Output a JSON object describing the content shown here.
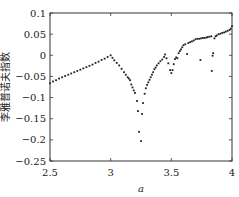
{
  "chart_data": {
    "type": "scatter",
    "title": "",
    "xlabel": "a",
    "ylabel": "李雅普诺夫指数",
    "xlim": [
      2.5,
      4
    ],
    "ylim": [
      -0.25,
      0.1
    ],
    "xticks": [
      2.5,
      3,
      3.5,
      4
    ],
    "xtick_labels": [
      "2.5",
      "3",
      "3.5",
      "4"
    ],
    "yticks": [
      0.1,
      0.05,
      0,
      -0.05,
      -0.1,
      -0.15,
      -0.2,
      -0.25
    ],
    "ytick_labels": [
      "0.1",
      "0.05",
      "0",
      "−0.05",
      "−0.1",
      "−0.15",
      "−0.2",
      "−0.25"
    ],
    "grid": false,
    "legend": null,
    "marker_color": "#222222",
    "series": [
      {
        "name": "Lyapunov exponent",
        "points": [
          [
            2.5,
            -0.066
          ],
          [
            2.525,
            -0.062
          ],
          [
            2.55,
            -0.059
          ],
          [
            2.575,
            -0.055
          ],
          [
            2.6,
            -0.052
          ],
          [
            2.625,
            -0.049
          ],
          [
            2.65,
            -0.046
          ],
          [
            2.675,
            -0.043
          ],
          [
            2.7,
            -0.04
          ],
          [
            2.725,
            -0.037
          ],
          [
            2.75,
            -0.034
          ],
          [
            2.775,
            -0.031
          ],
          [
            2.8,
            -0.028
          ],
          [
            2.825,
            -0.025
          ],
          [
            2.85,
            -0.022
          ],
          [
            2.875,
            -0.018
          ],
          [
            2.9,
            -0.015
          ],
          [
            2.925,
            -0.011
          ],
          [
            2.95,
            -0.008
          ],
          [
            2.975,
            -0.004
          ],
          [
            3.0,
            0.0
          ],
          [
            3.015,
            -0.006
          ],
          [
            3.03,
            -0.012
          ],
          [
            3.05,
            -0.018
          ],
          [
            3.07,
            -0.024
          ],
          [
            3.09,
            -0.032
          ],
          [
            3.11,
            -0.04
          ],
          [
            3.125,
            -0.046
          ],
          [
            3.14,
            -0.052
          ],
          [
            3.15,
            -0.055
          ],
          [
            3.16,
            -0.059
          ],
          [
            3.17,
            -0.069
          ],
          [
            3.18,
            -0.076
          ],
          [
            3.19,
            -0.083
          ],
          [
            3.2,
            -0.089
          ],
          [
            3.217,
            -0.108
          ],
          [
            3.225,
            -0.132
          ],
          [
            3.234,
            -0.181
          ],
          [
            3.25,
            -0.203
          ],
          [
            3.258,
            -0.139
          ],
          [
            3.267,
            -0.113
          ],
          [
            3.28,
            -0.091
          ],
          [
            3.29,
            -0.078
          ],
          [
            3.3,
            -0.07
          ],
          [
            3.31,
            -0.064
          ],
          [
            3.32,
            -0.058
          ],
          [
            3.33,
            -0.052
          ],
          [
            3.34,
            -0.046
          ],
          [
            3.35,
            -0.04
          ],
          [
            3.36,
            -0.033
          ],
          [
            3.37,
            -0.029
          ],
          [
            3.38,
            -0.024
          ],
          [
            3.395,
            -0.019
          ],
          [
            3.41,
            -0.014
          ],
          [
            3.425,
            -0.01
          ],
          [
            3.44,
            -0.004
          ],
          [
            3.448,
            0.002
          ],
          [
            3.46,
            -0.007
          ],
          [
            3.475,
            -0.019
          ],
          [
            3.49,
            -0.035
          ],
          [
            3.5,
            -0.042
          ],
          [
            3.51,
            -0.035
          ],
          [
            3.52,
            -0.021
          ],
          [
            3.53,
            -0.009
          ],
          [
            3.54,
            -0.005
          ],
          [
            3.55,
            -0.007
          ],
          [
            3.56,
            0.005
          ],
          [
            3.57,
            0.01
          ],
          [
            3.58,
            0.014
          ],
          [
            3.59,
            0.019
          ],
          [
            3.6,
            0.024
          ],
          [
            3.615,
            0.026
          ],
          [
            3.63,
            0.003
          ],
          [
            3.64,
            0.029
          ],
          [
            3.655,
            0.031
          ],
          [
            3.67,
            0.033
          ],
          [
            3.685,
            0.035
          ],
          [
            3.7,
            0.038
          ],
          [
            3.715,
            0.039
          ],
          [
            3.73,
            0.039
          ],
          [
            3.74,
            -0.011
          ],
          [
            3.745,
            0.04
          ],
          [
            3.76,
            0.041
          ],
          [
            3.775,
            0.041
          ],
          [
            3.79,
            0.042
          ],
          [
            3.8,
            0.043
          ],
          [
            3.815,
            0.044
          ],
          [
            3.83,
            0.045
          ],
          [
            3.833,
            -0.037
          ],
          [
            3.84,
            -0.001
          ],
          [
            3.845,
            0.005
          ],
          [
            3.855,
            0.04
          ],
          [
            3.865,
            0.045
          ],
          [
            3.875,
            0.047
          ],
          [
            3.89,
            0.05
          ],
          [
            3.905,
            0.051
          ],
          [
            3.92,
            0.053
          ],
          [
            3.935,
            0.054
          ],
          [
            3.95,
            0.056
          ],
          [
            3.965,
            0.058
          ],
          [
            3.98,
            0.06
          ],
          [
            3.99,
            0.063
          ],
          [
            4.0,
            0.069
          ]
        ]
      }
    ]
  }
}
